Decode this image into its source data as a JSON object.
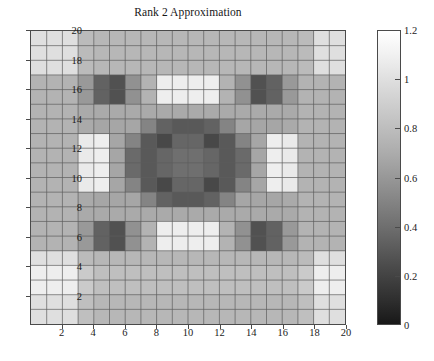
{
  "figure": {
    "title": "Rank 2 Approximation",
    "background": "#ffffff",
    "axis_color": "#4a4a4a"
  },
  "axes": {
    "x_ticks": [
      "2",
      "4",
      "6",
      "8",
      "10",
      "12",
      "14",
      "16",
      "18",
      "20"
    ],
    "y_ticks": [
      "20",
      "18",
      "16",
      "14",
      "12",
      "10",
      "8",
      "6",
      "4",
      "2"
    ],
    "x_range": [
      0,
      20
    ],
    "y_range": [
      0,
      20
    ]
  },
  "colorbar": {
    "ticks": [
      "1.2",
      "1",
      "0.8",
      "0.6",
      "0.4",
      "0.2",
      "0"
    ],
    "min": 0,
    "max": 1.2,
    "colormap": "gray",
    "orientation": "vertical",
    "position": "right"
  },
  "chart_data": {
    "type": "heatmap",
    "title": "Rank 2 Approximation",
    "xlabel": "",
    "ylabel": "",
    "xlim": [
      0,
      20
    ],
    "ylim": [
      0,
      20
    ],
    "grid": true,
    "colormap": "gray",
    "cmin": 0,
    "cmax": 1.2,
    "legend": "colorbar-right",
    "x": [
      1,
      2,
      3,
      4,
      5,
      6,
      7,
      8,
      9,
      10,
      11,
      12,
      13,
      14,
      15,
      16,
      17,
      18,
      19,
      20
    ],
    "y": [
      1,
      2,
      3,
      4,
      5,
      6,
      7,
      8,
      9,
      10,
      11,
      12,
      13,
      14,
      15,
      16,
      17,
      18,
      19,
      20
    ],
    "row_order": "top_row_is_y20",
    "values": [
      [
        1.05,
        1.05,
        1.05,
        0.88,
        0.86,
        0.86,
        0.86,
        0.86,
        0.86,
        0.86,
        0.86,
        0.86,
        0.86,
        0.86,
        0.86,
        0.86,
        0.86,
        0.88,
        1.05,
        1.05
      ],
      [
        1.05,
        1.05,
        1.05,
        0.88,
        0.86,
        0.86,
        0.86,
        0.86,
        0.86,
        0.86,
        0.86,
        0.86,
        0.86,
        0.86,
        0.86,
        0.86,
        0.86,
        0.88,
        1.05,
        1.05
      ],
      [
        1.05,
        1.05,
        1.05,
        0.88,
        0.86,
        0.86,
        0.86,
        0.86,
        0.86,
        0.86,
        0.86,
        0.86,
        0.86,
        0.86,
        0.86,
        0.86,
        0.86,
        0.88,
        1.05,
        1.05
      ],
      [
        0.84,
        0.84,
        0.84,
        0.72,
        0.46,
        0.38,
        0.68,
        0.84,
        1.12,
        1.12,
        1.12,
        1.12,
        0.84,
        0.68,
        0.38,
        0.46,
        0.72,
        0.84,
        0.84,
        0.84
      ],
      [
        0.84,
        0.84,
        0.84,
        0.72,
        0.46,
        0.38,
        0.68,
        0.84,
        1.12,
        1.12,
        1.12,
        1.12,
        0.84,
        0.68,
        0.38,
        0.46,
        0.72,
        0.84,
        0.84,
        0.84
      ],
      [
        0.84,
        0.84,
        0.84,
        0.8,
        0.8,
        0.8,
        0.8,
        0.8,
        0.8,
        0.8,
        0.8,
        0.8,
        0.8,
        0.8,
        0.8,
        0.8,
        0.8,
        0.84,
        0.84,
        0.84
      ],
      [
        0.84,
        0.84,
        0.84,
        0.8,
        0.78,
        0.78,
        0.78,
        0.62,
        0.46,
        0.42,
        0.42,
        0.46,
        0.62,
        0.78,
        0.78,
        0.78,
        0.8,
        0.84,
        0.84,
        0.84
      ],
      [
        0.84,
        0.84,
        0.84,
        1.1,
        1.12,
        0.78,
        0.62,
        0.42,
        0.34,
        0.48,
        0.48,
        0.34,
        0.42,
        0.62,
        0.78,
        1.12,
        1.1,
        0.84,
        0.84,
        0.84
      ],
      [
        0.84,
        0.84,
        0.84,
        1.1,
        1.12,
        0.78,
        0.5,
        0.42,
        0.48,
        0.52,
        0.52,
        0.48,
        0.42,
        0.5,
        0.78,
        1.12,
        1.1,
        0.84,
        0.84,
        0.84
      ],
      [
        0.84,
        0.84,
        0.84,
        1.1,
        1.12,
        0.78,
        0.5,
        0.42,
        0.48,
        0.52,
        0.52,
        0.48,
        0.42,
        0.5,
        0.78,
        1.12,
        1.1,
        0.84,
        0.84,
        0.84
      ],
      [
        0.84,
        0.84,
        0.84,
        1.1,
        1.12,
        0.78,
        0.62,
        0.42,
        0.34,
        0.48,
        0.48,
        0.34,
        0.42,
        0.62,
        0.78,
        1.12,
        1.1,
        0.84,
        0.84,
        0.84
      ],
      [
        0.84,
        0.84,
        0.84,
        0.8,
        0.78,
        0.78,
        0.78,
        0.62,
        0.46,
        0.42,
        0.42,
        0.46,
        0.62,
        0.78,
        0.78,
        0.78,
        0.8,
        0.84,
        0.84,
        0.84
      ],
      [
        0.84,
        0.84,
        0.84,
        0.8,
        0.8,
        0.8,
        0.8,
        0.8,
        0.8,
        0.8,
        0.8,
        0.8,
        0.8,
        0.8,
        0.8,
        0.8,
        0.8,
        0.84,
        0.84,
        0.84
      ],
      [
        0.84,
        0.84,
        0.84,
        0.72,
        0.46,
        0.38,
        0.68,
        0.84,
        1.12,
        1.12,
        1.12,
        1.12,
        0.84,
        0.68,
        0.38,
        0.46,
        0.72,
        0.84,
        0.84,
        0.84
      ],
      [
        0.84,
        0.84,
        0.84,
        0.72,
        0.46,
        0.38,
        0.68,
        0.84,
        1.12,
        1.12,
        1.12,
        1.12,
        0.84,
        0.68,
        0.38,
        0.46,
        0.72,
        0.84,
        0.84,
        0.84
      ],
      [
        1.05,
        1.05,
        1.05,
        0.88,
        0.86,
        0.86,
        0.86,
        0.86,
        0.86,
        0.86,
        0.86,
        0.86,
        0.86,
        0.86,
        0.86,
        0.86,
        0.86,
        0.88,
        1.05,
        1.05
      ],
      [
        1.12,
        1.12,
        1.12,
        0.95,
        0.9,
        0.9,
        0.9,
        0.9,
        0.9,
        0.9,
        0.9,
        0.9,
        0.9,
        0.9,
        0.9,
        0.9,
        0.9,
        0.95,
        1.12,
        1.12
      ],
      [
        1.12,
        1.12,
        1.12,
        0.95,
        0.9,
        0.9,
        0.9,
        0.9,
        0.9,
        0.9,
        0.9,
        0.9,
        0.9,
        0.9,
        0.9,
        0.9,
        0.9,
        0.95,
        1.12,
        1.12
      ],
      [
        1.05,
        1.05,
        1.05,
        0.9,
        0.86,
        0.86,
        0.86,
        0.86,
        0.86,
        0.86,
        0.86,
        0.86,
        0.86,
        0.86,
        0.86,
        0.86,
        0.86,
        0.9,
        1.05,
        1.05
      ],
      [
        1.05,
        1.05,
        1.05,
        0.9,
        0.86,
        0.86,
        0.86,
        0.86,
        0.86,
        0.86,
        0.86,
        0.86,
        0.86,
        0.86,
        0.86,
        0.86,
        0.86,
        0.9,
        1.05,
        1.05
      ]
    ]
  }
}
